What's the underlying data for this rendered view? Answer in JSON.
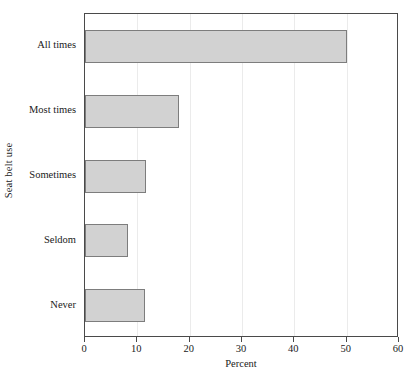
{
  "chart_data": {
    "type": "bar",
    "orientation": "horizontal",
    "title": "",
    "xlabel": "Percent",
    "ylabel": "Seat belt use",
    "categories": [
      "All times",
      "Most times",
      "Sometimes",
      "Seldom",
      "Never"
    ],
    "values": [
      50,
      18,
      11.7,
      8.3,
      11.4
    ],
    "xlim": [
      0,
      60
    ],
    "xticks": [
      0,
      10,
      20,
      30,
      40,
      50,
      60
    ],
    "xtick_labels": [
      "0",
      "10",
      "20",
      "30",
      "40",
      "50",
      "60"
    ],
    "grid": true,
    "legend": null,
    "series": [
      {
        "name": "Percent",
        "values": [
          50,
          18,
          11.7,
          8.3,
          11.4
        ]
      }
    ],
    "colors": {
      "bar_fill": "#d2d2d2",
      "bar_stroke": "#7d7d7d",
      "frame": "#4a4a4a",
      "gridline": "#ebebeb",
      "text": "#1a1a1a",
      "background": "#ffffff"
    }
  }
}
